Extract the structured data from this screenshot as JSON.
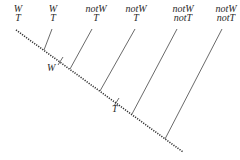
{
  "diagram": {
    "leaves": [
      {
        "top": "W",
        "bottom": "T",
        "x": 18
      },
      {
        "top": "W",
        "bottom": "T",
        "x": 53
      },
      {
        "top": "notW",
        "bottom": "T",
        "x": 96
      },
      {
        "top": "notW",
        "bottom": "T",
        "x": 135
      },
      {
        "top": "notW",
        "bottom": "notT",
        "x": 182
      },
      {
        "top": "notW",
        "bottom": "notT",
        "x": 225
      }
    ],
    "markers": [
      {
        "label": "W"
      },
      {
        "label": "T"
      }
    ],
    "colors": {
      "line": "#333333"
    }
  }
}
